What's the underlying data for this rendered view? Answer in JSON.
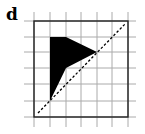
{
  "figure": {
    "label": "d",
    "grid": {
      "columns": 6,
      "rows": 6,
      "x_lines": [
        34,
        50,
        66,
        81,
        97,
        112,
        128
      ],
      "y_lines": [
        21,
        37,
        52,
        68,
        84,
        101,
        117
      ],
      "grid_color": "#aaaaaa",
      "border_color": "#222222"
    },
    "shape": {
      "fill": "#000000",
      "points": "50,37 66,37 97,52 66,68 50,101"
    },
    "mirror_line": {
      "style": "dashed",
      "x1": 38,
      "y1": 113,
      "x2": 126,
      "y2": 23
    }
  }
}
